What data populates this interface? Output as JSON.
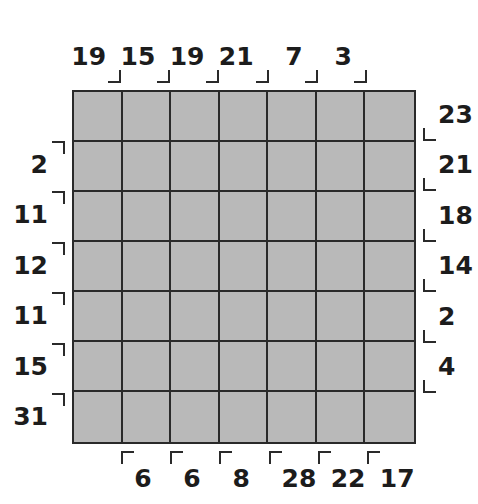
{
  "figure": {
    "kind": "labelled-grid-diagram",
    "grid": {
      "columns": 7,
      "rows": 7,
      "cell_fill_color": "#b9b9b9",
      "line_color": "#2a2a2a",
      "background_color": "#ffffff"
    },
    "tick_glyphs": {
      "top": "corner-bottom-right",
      "bottom": "corner-top-left",
      "left": "corner-top-right",
      "right": "corner-bottom-left"
    }
  },
  "chart_data": {
    "type": "table",
    "title": "",
    "subtitle": "",
    "xlabel": "",
    "ylabel": "",
    "grid": true,
    "legend": "none",
    "rows": 7,
    "columns": 7,
    "top_labels": [
      "19",
      "15",
      "19",
      "21",
      "7",
      "3"
    ],
    "bottom_labels": [
      "6",
      "6",
      "8",
      "28",
      "22",
      "17"
    ],
    "left_labels": [
      "2",
      "11",
      "12",
      "11",
      "15",
      "31"
    ],
    "right_labels": [
      "23",
      "21",
      "18",
      "14",
      "2",
      "4"
    ],
    "top_values": [
      19,
      15,
      19,
      21,
      7,
      3
    ],
    "bottom_values": [
      6,
      6,
      8,
      28,
      22,
      17
    ],
    "left_values": [
      2,
      11,
      12,
      11,
      15,
      31
    ],
    "right_values": [
      23,
      21,
      18,
      14,
      2,
      4
    ]
  }
}
